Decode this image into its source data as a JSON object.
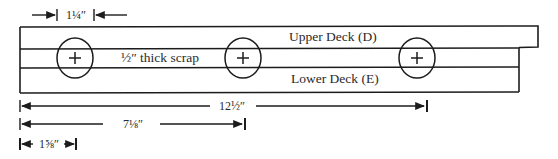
{
  "diagram": {
    "labels": {
      "upper_deck": "Upper Deck (D)",
      "scrap": "½″ thick scrap",
      "lower_deck": "Lower Deck (E)"
    },
    "dimensions": {
      "hole_diameter": "1¼″",
      "total_to_third_hole": "12½″",
      "to_second_hole": "7⅛″",
      "to_first_hole": "1⅝″"
    },
    "holes": [
      {
        "name": "hole-1",
        "cx": 75
      },
      {
        "name": "hole-2",
        "cx": 243
      },
      {
        "name": "hole-3",
        "cx": 417
      }
    ],
    "colors": {
      "line": "#1c1c1c",
      "background": "#ffffff"
    }
  }
}
